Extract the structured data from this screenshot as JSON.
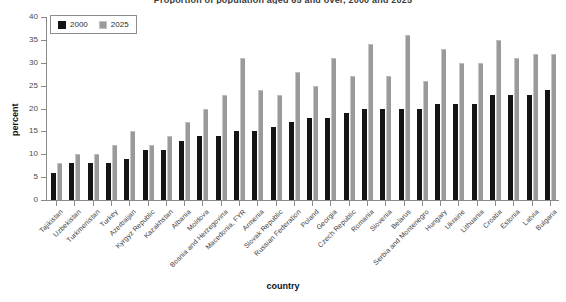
{
  "chart_data": {
    "type": "bar",
    "title": "Proportion of population aged 65 and over, 2000 and 2025",
    "xlabel": "country",
    "ylabel": "percent",
    "ylim": [
      0,
      40
    ],
    "yticks": [
      0,
      5,
      10,
      15,
      20,
      25,
      30,
      35,
      40
    ],
    "grid": false,
    "legend_position": "top-left",
    "categories": [
      "Tajikistan",
      "Uzbekistan",
      "Turkmenistan",
      "Turkey",
      "Azerbaijan",
      "Kyrgyz Republic",
      "Kazakhstan",
      "Albania",
      "Moldova",
      "Bosnia and Herzegovina",
      "Macedonia, FYR",
      "Armenia",
      "Slovak Republic",
      "Russian Federation",
      "Poland",
      "Georgia",
      "Czech Republic",
      "Romania",
      "Slovenia",
      "Belarus",
      "Serbia and Montenegro",
      "Hungary",
      "Ukraine",
      "Lithuania",
      "Croatia",
      "Estonia",
      "Latvia",
      "Bulgaria"
    ],
    "series": [
      {
        "name": "2000",
        "color": "#141414",
        "values": [
          6,
          8,
          8,
          8,
          9,
          11,
          11,
          13,
          14,
          14,
          15,
          15,
          16,
          17,
          18,
          18,
          19,
          20,
          20,
          20,
          20,
          21,
          21,
          21,
          23,
          23,
          23,
          24
        ]
      },
      {
        "name": "2025",
        "color": "#9a9a9a",
        "values": [
          8,
          10,
          10,
          12,
          15,
          12,
          14,
          17,
          20,
          23,
          31,
          24,
          23,
          28,
          25,
          31,
          27,
          34,
          27,
          36,
          26,
          33,
          30,
          30,
          35,
          31,
          32,
          32
        ]
      }
    ]
  },
  "legend": {
    "items": [
      {
        "label": "2000",
        "swatch": "black-square-icon"
      },
      {
        "label": "2025",
        "swatch": "gray-square-icon"
      }
    ]
  }
}
